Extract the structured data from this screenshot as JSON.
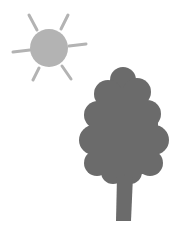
{
  "scene": {
    "title": "Sun and tree illustration",
    "colors": {
      "background": "#ffffff",
      "sun": "#b3b3b3",
      "tree": "#6b6b6b"
    },
    "sun": {
      "cx": 49,
      "cy": 48,
      "r": 19
    },
    "tree": {
      "canopy": "rounded cloud shape",
      "trunk": "tapered"
    }
  }
}
